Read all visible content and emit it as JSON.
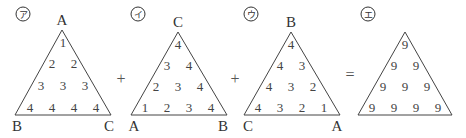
{
  "diagram": {
    "triangles": [
      {
        "label": "ア",
        "vertices": {
          "top": "A",
          "left": "B",
          "right": "C"
        },
        "rows": [
          [
            "1"
          ],
          [
            "2",
            "2"
          ],
          [
            "3",
            "3",
            "3"
          ],
          [
            "4",
            "4",
            "4",
            "4"
          ]
        ]
      },
      {
        "label": "イ",
        "vertices": {
          "top": "C",
          "left": "A",
          "right": "B"
        },
        "rows": [
          [
            "4"
          ],
          [
            "3",
            "4"
          ],
          [
            "2",
            "3",
            "4"
          ],
          [
            "1",
            "2",
            "3",
            "4"
          ]
        ]
      },
      {
        "label": "ウ",
        "vertices": {
          "top": "B",
          "left": "C",
          "right": "A"
        },
        "rows": [
          [
            "4"
          ],
          [
            "4",
            "3"
          ],
          [
            "4",
            "3",
            "2"
          ],
          [
            "4",
            "3",
            "2",
            "1"
          ]
        ]
      },
      {
        "label": "エ",
        "vertices": {
          "top": "",
          "left": "",
          "right": ""
        },
        "rows": [
          [
            "9"
          ],
          [
            "9",
            "9"
          ],
          [
            "9",
            "9",
            "9"
          ],
          [
            "9",
            "9",
            "9",
            "9"
          ]
        ]
      }
    ],
    "operators": [
      "+",
      "+",
      "="
    ]
  }
}
